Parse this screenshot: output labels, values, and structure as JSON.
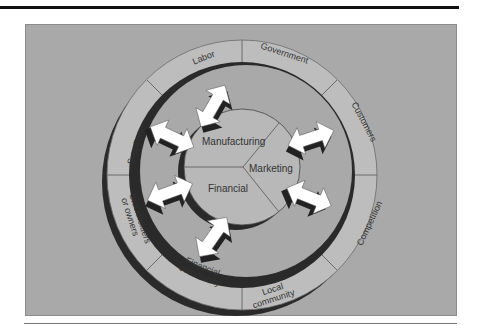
{
  "figure": {
    "inner_circle": {
      "segments": [
        {
          "label": "Manufacturing"
        },
        {
          "label": "Marketing"
        },
        {
          "label": "Financial"
        }
      ]
    },
    "outer_ring": {
      "segments": [
        {
          "label": "Labor"
        },
        {
          "label": "Government"
        },
        {
          "label": "Customers"
        },
        {
          "label": "Competition"
        },
        {
          "label": "Local community",
          "line1": "Local",
          "line2": "community"
        },
        {
          "label": "Financial community",
          "line1": "Financial",
          "line2": "community"
        },
        {
          "label": "Stockholders or owners",
          "line1": "Stockholders",
          "line2": "or owners"
        },
        {
          "label": "Suppliers"
        }
      ]
    },
    "arrows": {
      "count": 6,
      "style": "white double-headed arrows with dark drop shadow",
      "connects": [
        "Labor",
        "Suppliers",
        "Stockholders or owners",
        "Financial community",
        "Customers",
        "Competition"
      ]
    },
    "colors": {
      "panel": "#a9a9a9",
      "ring_band": "#bdbdbd",
      "inner_circle": "#b8b8b8",
      "shadow": "#2a2a2a",
      "arrow": "#ffffff",
      "text": "#333333"
    }
  }
}
